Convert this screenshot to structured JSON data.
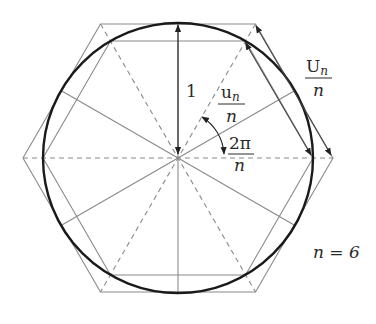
{
  "diagram": {
    "n_value_label": "n = 6",
    "radius_label": "1",
    "inner_side_label": {
      "numerator": "u",
      "subscript": "n",
      "denominator": "n"
    },
    "outer_side_label": {
      "numerator": "U",
      "subscript": "n",
      "denominator": "n"
    },
    "angle_label": {
      "numerator": "2π",
      "denominator": "n"
    },
    "geometry": {
      "center": [
        178,
        158
      ],
      "circle_radius": 135,
      "inscribed_hexagon_circumradius": 135,
      "circumscribed_hexagon_circumradius": 155,
      "sides": 6
    },
    "colors": {
      "circle": "#1a1a1a",
      "polygon_lines": "#8a8a8a",
      "dashed_lines": "#8a8a8a",
      "arrows": "#222222",
      "text": "#2a2a2a"
    }
  }
}
